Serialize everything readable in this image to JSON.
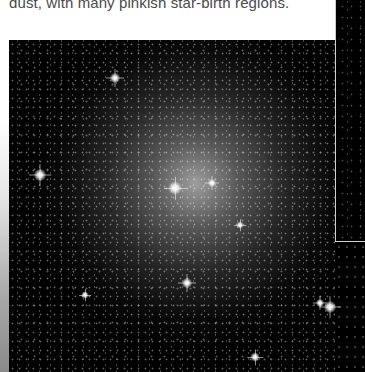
{
  "caption": {
    "text": "dust, with many pinkish star-birth regions."
  },
  "main_image": {
    "subject": "globular star cluster / dense star field photograph",
    "background_color": "#000000",
    "bright_stars": [
      {
        "x": 40,
        "y": 175,
        "size": 12
      },
      {
        "x": 115,
        "y": 78,
        "size": 10
      },
      {
        "x": 175,
        "y": 188,
        "size": 13
      },
      {
        "x": 187,
        "y": 283,
        "size": 10
      },
      {
        "x": 330,
        "y": 307,
        "size": 12
      },
      {
        "x": 320,
        "y": 303,
        "size": 8
      },
      {
        "x": 255,
        "y": 357,
        "size": 9
      },
      {
        "x": 240,
        "y": 225,
        "size": 7
      },
      {
        "x": 212,
        "y": 183,
        "size": 8
      },
      {
        "x": 85,
        "y": 295,
        "size": 7
      }
    ]
  },
  "right_panel": {
    "subject": "adjacent star field photograph (cropped)",
    "border_color": "#cfcfcf"
  }
}
